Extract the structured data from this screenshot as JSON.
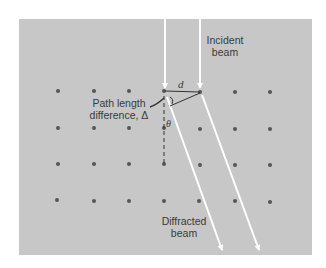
{
  "figure": {
    "type": "diffraction-grating-diagram",
    "labels": {
      "incident_line1": "Incident",
      "incident_line2": "beam",
      "path_line1": "Path length",
      "path_line2": "difference, Δ",
      "diffracted_line1": "Diffracted",
      "diffracted_line2": "beam",
      "spacing": "d",
      "angle": "θ"
    },
    "lattice": {
      "columns_x": [
        58,
        94,
        129,
        164,
        200,
        235,
        270
      ],
      "rows_y": [
        91,
        128,
        164,
        201
      ],
      "dot_count": 28
    },
    "colors": {
      "background": "#c7c7c7",
      "dots": "#555555",
      "beams": "#ffffff",
      "text": "#3a3a3a"
    }
  }
}
